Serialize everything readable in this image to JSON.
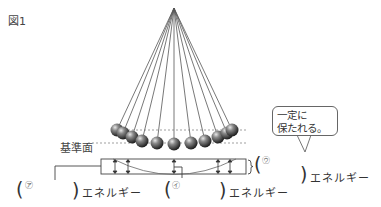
{
  "figure": {
    "label": "図1",
    "reference_plane_label": "基準面",
    "speech_bubble": {
      "line1": "一定に",
      "line2": "保たれる。"
    },
    "blanks": [
      {
        "symbol": "㋐",
        "suffix": "エネルギー"
      },
      {
        "symbol": "㋑",
        "suffix": "エネルギー"
      },
      {
        "symbol": "㋒",
        "suffix": "エネルギー"
      }
    ],
    "pendulum": {
      "pivot": [
        174,
        8
      ],
      "ball_count": 11,
      "ball_color": "#555555"
    }
  }
}
